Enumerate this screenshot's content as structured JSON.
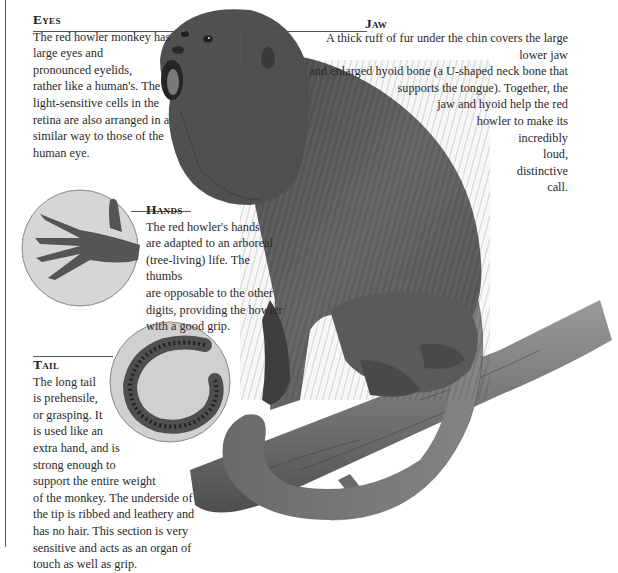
{
  "illustration": {
    "subject": "Red howler monkey sitting on a branch, mouth open howling",
    "insets": [
      "hand-closeup",
      "tail-tip-closeup"
    ],
    "colors": {
      "fur_dark": "#3a3a3a",
      "fur_mid": "#6b6b6b",
      "fur_light": "#9a9a9a",
      "bark": "#7d7d7d",
      "inset_bg": "#d8d8d8",
      "rule": "#555555",
      "text": "#2a2a2a"
    }
  },
  "labels": {
    "eyes": {
      "heading": "Eyes",
      "body": "The red howler monkey has\nlarge eyes and\npronounced eyelids,\nrather like a human's. The\nlight-sensitive cells in the\nretina are also arranged in a\nsimilar way to those of the\nhuman eye."
    },
    "jaw": {
      "heading": "Jaw",
      "body": "A thick ruff of fur under the chin covers the large lower jaw\nand enlarged hyoid bone (a U-shaped neck bone that\nsupports the tongue). Together, the\njaw and hyoid help the red\nhowler to make its\nincredibly\nloud,\ndistinctive\ncall."
    },
    "hands": {
      "heading": "Hands",
      "body": "The red howler's hands\nare adapted to an arboreal\n(tree-living)  life. The thumbs\nare opposable to the other\ndigits, providing the howler\nwith a good grip."
    },
    "tail": {
      "heading": "Tail",
      "body": "The long tail\nis prehensile,\nor grasping. It\nis used like an\nextra hand, and is\nstrong enough to\nsupport the entire weight\nof the monkey. The underside of\nthe tip is ribbed and leathery and\nhas no hair. This section is very\nsensitive and acts as an organ of\ntouch as well as grip."
    }
  }
}
